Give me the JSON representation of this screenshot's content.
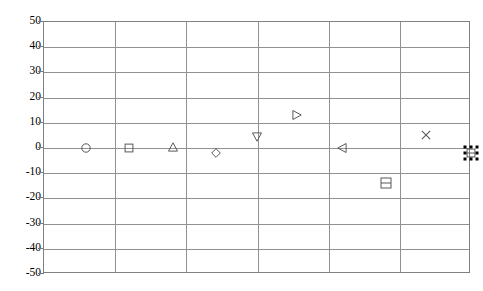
{
  "chart_data": {
    "type": "scatter",
    "title": "",
    "subtitle": "",
    "xlabel": "",
    "ylabel": "",
    "ylim": [
      -50,
      50
    ],
    "ytick_values": [
      50,
      40,
      30,
      20,
      10,
      0,
      -10,
      -20,
      -30,
      -40,
      -50
    ],
    "ytick_labels": [
      "50",
      "40",
      "30",
      "20",
      "10",
      "0",
      "-10",
      "-20",
      "-30",
      "-40",
      "-50"
    ],
    "xlim": [
      0,
      10
    ],
    "xtick_labels": [],
    "grid": {
      "horizontal": true,
      "vertical": true,
      "vertical_count": 5,
      "color": "#919191"
    },
    "legend": {
      "visible": false,
      "position": "none"
    },
    "plot_frame_color": "#808080",
    "marker_color": "#595959",
    "points": [
      {
        "name": "point-circle",
        "marker": "circle",
        "x": 0.99,
        "y": 0,
        "px": 85,
        "py": 147
      },
      {
        "name": "point-square",
        "marker": "square",
        "x": 2.0,
        "y": 0,
        "px": 128,
        "py": 147
      },
      {
        "name": "point-triangle-up",
        "marker": "triangle-up",
        "x": 3.02,
        "y": 0,
        "px": 172,
        "py": 146
      },
      {
        "name": "point-diamond",
        "marker": "diamond",
        "x": 4.03,
        "y": -3,
        "px": 215,
        "py": 152
      },
      {
        "name": "point-triangle-down",
        "marker": "triangle-down",
        "x": 4.99,
        "y": 5,
        "px": 256,
        "py": 136
      },
      {
        "name": "point-triangle-right",
        "marker": "triangle-right",
        "x": 5.93,
        "y": 13,
        "px": 296,
        "py": 114
      },
      {
        "name": "point-triangle-left",
        "marker": "triangle-left",
        "x": 6.98,
        "y": 0,
        "px": 341,
        "py": 147
      },
      {
        "name": "point-barred-square",
        "marker": "square-barred",
        "x": 8.01,
        "y": -14,
        "px": 385,
        "py": 182
      },
      {
        "name": "point-cross-x",
        "marker": "x-cross",
        "x": 8.95,
        "y": 5,
        "px": 425,
        "py": 134
      },
      {
        "name": "point-selected",
        "marker": "selected-square",
        "x": 10.0,
        "y": -3,
        "px": 470,
        "py": 152,
        "selected": true
      }
    ]
  }
}
